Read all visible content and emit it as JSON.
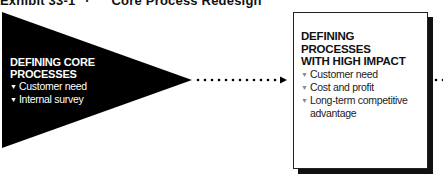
{
  "title": {
    "exhibit": "Exhibit 33-1",
    "separator": "·",
    "text": "Core Process Redesign"
  },
  "stages": [
    {
      "heading_line1": "DEFINING CORE",
      "heading_line2": "PROCESSES",
      "items": [
        "Customer need",
        "Internal survey"
      ],
      "shape": "triangle",
      "fill": "#000000"
    },
    {
      "heading_line1": "DEFINING PROCESSES",
      "heading_line2": "WITH HIGH IMPACT",
      "items": [
        "Customer need",
        "Cost and profit",
        "Long-term competitive",
        "advantage"
      ],
      "shape": "box",
      "fill": "#ffffff"
    }
  ],
  "bullet_glyph": "▼",
  "connectors": [
    "dotted-arrow",
    "dotted-continuation"
  ]
}
